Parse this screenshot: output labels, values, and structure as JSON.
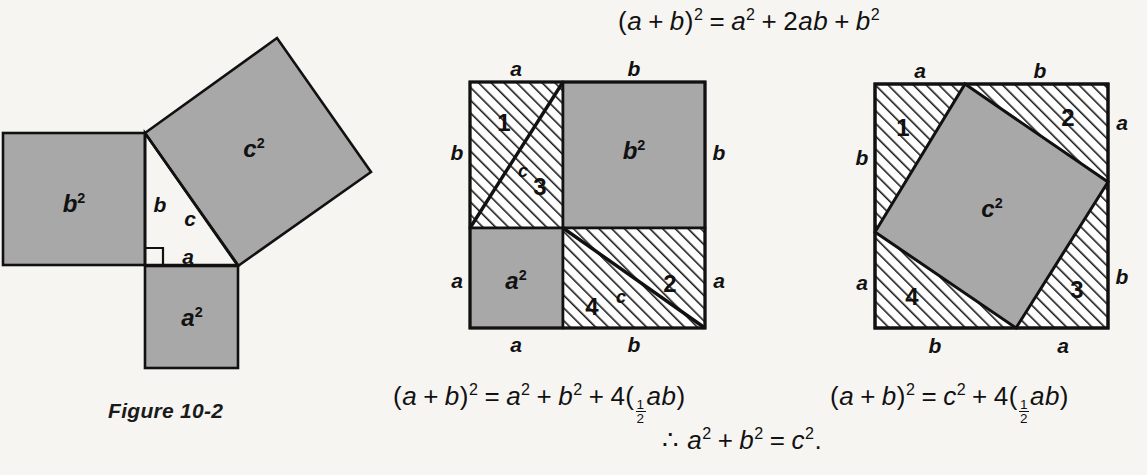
{
  "page": {
    "background_color": "#f6f5f2",
    "ink_color": "#111111",
    "shade_color": "#a8a8a8",
    "hatch_color": "#1a1a1a"
  },
  "equations": {
    "top": "(a + b)² = a² + 2ab + b²",
    "left_bottom": "(a + b)² = a² + b² + 4(½ab)",
    "right_bottom": "(a + b)² = c² + 4(½ab)",
    "conclusion": "∴ a² + b² = c²."
  },
  "caption": "Figure 10-2",
  "figure1": {
    "name": "pythagorean-squares-on-triangle",
    "labels": {
      "b_square": "b",
      "b_square_exp": "2",
      "c_square": "c",
      "c_square_exp": "2",
      "a_square": "a",
      "a_square_exp": "2",
      "side_a": "a",
      "side_b": "b",
      "side_c": "c"
    }
  },
  "figure2": {
    "name": "square-dissection-a2-b2",
    "labels": {
      "top_left_side": "a",
      "top_right_side": "b",
      "left_upper_side": "b",
      "left_lower_side": "a",
      "right_upper_side": "b",
      "right_lower_side": "a",
      "bottom_left_side": "a",
      "bottom_right_side": "b",
      "region_b_square": "b",
      "region_b_square_exp": "2",
      "region_a_square": "a",
      "region_a_square_exp": "2",
      "triangle_1": "1",
      "triangle_2": "2",
      "triangle_3": "3",
      "triangle_4": "4",
      "hyp_upper": "c",
      "hyp_lower": "c"
    }
  },
  "figure3": {
    "name": "square-dissection-c2",
    "labels": {
      "top_left_side": "a",
      "top_right_side": "b",
      "left_upper_side": "b",
      "left_lower_side": "a",
      "right_upper_side": "a",
      "right_lower_side": "b",
      "bottom_left_side": "b",
      "bottom_right_side": "a",
      "region_c_square": "c",
      "region_c_square_exp": "2",
      "triangle_1": "1",
      "triangle_2": "2",
      "triangle_3": "3",
      "triangle_4": "4"
    }
  }
}
